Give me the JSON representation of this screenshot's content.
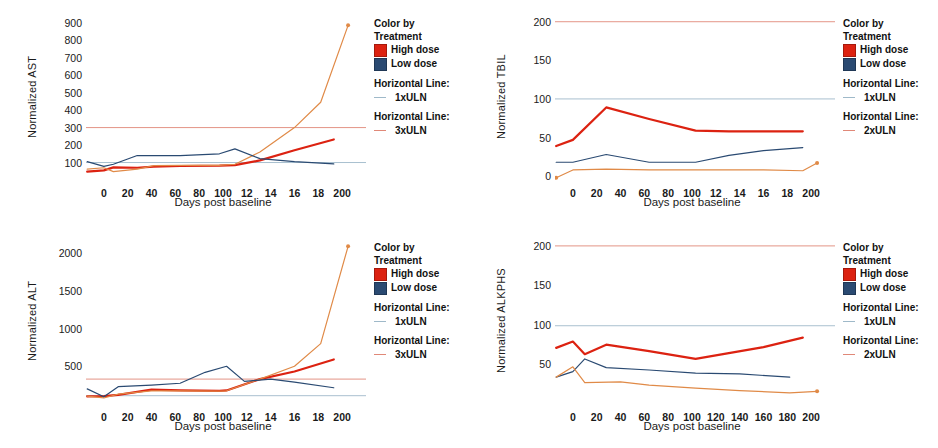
{
  "colors": {
    "high_dose": "#DC2211",
    "low_dose": "#2A4A72",
    "uln1": "#9FB9C9",
    "uln2": "#D98A6B",
    "uln3": "#E08878",
    "patient_orange": "#E08A47",
    "axis": "#4a4a4a",
    "text": "#1a1a1a",
    "background": "#ffffff"
  },
  "legend": {
    "color_by_line1": "Color by",
    "color_by_line2": "Treatment",
    "high_dose": "High dose",
    "low_dose": "Low dose",
    "horizontal_line_label": "Horizontal Line:"
  },
  "panels": [
    {
      "id": "ast",
      "ylabel": "Normalized AST",
      "xlabel": "Days post baseline",
      "yticks": [
        "100",
        "200",
        "300",
        "400",
        "500",
        "600",
        "700",
        "800",
        "900"
      ],
      "xticks": [
        "0",
        "20",
        "40",
        "60",
        "80",
        "100",
        "12",
        "14",
        "16",
        "18",
        "200"
      ],
      "ref1": "1xULN",
      "ref2": "3xULN"
    },
    {
      "id": "tbil",
      "ylabel": "Normalized TBIL",
      "xlabel": "Days post baseline",
      "yticks": [
        "0",
        "50",
        "100",
        "150",
        "200"
      ],
      "xticks": [
        "0",
        "20",
        "40",
        "60",
        "80",
        "100",
        "12",
        "14",
        "16",
        "18",
        "200"
      ],
      "ref1": "1xULN",
      "ref2": "2xULN"
    },
    {
      "id": "alt",
      "ylabel": "Normalized ALT",
      "xlabel": "Days post baseline",
      "yticks": [
        "500",
        "1000",
        "1500",
        "2000"
      ],
      "xticks": [
        "0",
        "20",
        "40",
        "60",
        "80",
        "100",
        "12",
        "14",
        "16",
        "18",
        "200"
      ],
      "ref1": "1xULN",
      "ref2": "3xULN"
    },
    {
      "id": "alkphs",
      "ylabel": "Normalized ALKPHS",
      "xlabel": "Days post baseline",
      "yticks": [
        "50",
        "100",
        "150",
        "200"
      ],
      "xticks": [
        "0",
        "20",
        "40",
        "60",
        "80",
        "100",
        "120",
        "140",
        "160",
        "180",
        "200"
      ],
      "ref1": "1xULN",
      "ref2": "2xULN"
    }
  ],
  "chart_data": [
    {
      "id": "ast",
      "type": "line",
      "title": "",
      "xlabel": "Days post baseline",
      "ylabel": "Normalized AST",
      "xlim": [
        -15,
        215
      ],
      "ylim": [
        0,
        950
      ],
      "grid": false,
      "legend_position": "right",
      "reference_lines": [
        {
          "name": "1xULN",
          "value": 100,
          "color": "#9FB9C9"
        },
        {
          "name": "3xULN",
          "value": 300,
          "color": "#E08878"
        }
      ],
      "series": [
        {
          "name": "High dose subject A",
          "color": "#DC2211",
          "x": [
            -14,
            0,
            8,
            28,
            42,
            64,
            97,
            110,
            131,
            160,
            193
          ],
          "y": [
            48,
            55,
            72,
            70,
            76,
            80,
            82,
            85,
            112,
            170,
            232
          ]
        },
        {
          "name": "High dose subject B (escalating)",
          "color": "#E08A47",
          "x": [
            -14,
            0,
            8,
            28,
            42,
            64,
            97,
            110,
            131,
            160,
            182,
            205
          ],
          "y": [
            62,
            70,
            48,
            62,
            82,
            84,
            84,
            90,
            160,
            300,
            445,
            885
          ],
          "marker_last": true
        },
        {
          "name": "Low dose subject",
          "color": "#2A4A72",
          "x": [
            -14,
            0,
            8,
            28,
            42,
            64,
            97,
            110,
            131,
            160,
            193
          ],
          "y": [
            105,
            78,
            90,
            140,
            140,
            140,
            150,
            178,
            122,
            105,
            92
          ]
        }
      ]
    },
    {
      "id": "tbil",
      "type": "line",
      "title": "",
      "xlabel": "Days post baseline",
      "ylabel": "Normalized TBIL",
      "xlim": [
        -15,
        215
      ],
      "ylim": [
        -5,
        210
      ],
      "grid": false,
      "legend_position": "right",
      "reference_lines": [
        {
          "name": "1xULN",
          "value": 100,
          "color": "#9FB9C9"
        },
        {
          "name": "2xULN",
          "value": 200,
          "color": "#E08878"
        }
      ],
      "series": [
        {
          "name": "High dose subject",
          "color": "#DC2211",
          "x": [
            -14,
            0,
            28,
            64,
            103,
            131,
            160,
            193
          ],
          "y": [
            39,
            47,
            89,
            74,
            59,
            58,
            58,
            58
          ]
        },
        {
          "name": "Low dose subject",
          "color": "#2A4A72",
          "x": [
            -14,
            0,
            28,
            64,
            103,
            131,
            160,
            193
          ],
          "y": [
            18,
            18,
            28,
            18,
            18,
            27,
            33,
            37
          ]
        },
        {
          "name": "Second subject (orange)",
          "color": "#E08A47",
          "x": [
            -14,
            0,
            28,
            64,
            103,
            160,
            193,
            205
          ],
          "y": [
            -2,
            8,
            9,
            8,
            8,
            8,
            7,
            17
          ],
          "marker_first": true,
          "marker_last": true
        }
      ]
    },
    {
      "id": "alt",
      "type": "line",
      "title": "",
      "xlabel": "Days post baseline",
      "ylabel": "Normalized ALT",
      "xlim": [
        -15,
        215
      ],
      "ylim": [
        0,
        2200
      ],
      "grid": false,
      "legend_position": "right",
      "reference_lines": [
        {
          "name": "1xULN",
          "value": 110,
          "color": "#9FB9C9"
        },
        {
          "name": "3xULN",
          "value": 330,
          "color": "#E08878"
        }
      ],
      "series": [
        {
          "name": "High dose subject A",
          "color": "#DC2211",
          "x": [
            -14,
            0,
            12,
            40,
            64,
            97,
            103,
            131,
            160,
            193
          ],
          "y": [
            100,
            105,
            120,
            190,
            180,
            175,
            180,
            330,
            430,
            590
          ]
        },
        {
          "name": "High dose subject B (escalating)",
          "color": "#E08A47",
          "x": [
            -14,
            0,
            12,
            40,
            64,
            97,
            103,
            131,
            160,
            182,
            205
          ],
          "y": [
            105,
            80,
            130,
            175,
            175,
            170,
            175,
            330,
            500,
            800,
            2090
          ],
          "marker_last": true
        },
        {
          "name": "Low dose subject",
          "color": "#2A4A72",
          "x": [
            -14,
            0,
            12,
            40,
            64,
            85,
            103,
            118,
            140,
            160,
            193
          ],
          "y": [
            200,
            95,
            230,
            250,
            275,
            420,
            500,
            300,
            330,
            290,
            215
          ]
        }
      ]
    },
    {
      "id": "alkphs",
      "type": "line",
      "title": "",
      "xlabel": "Days post baseline",
      "ylabel": "Normalized ALKPHS",
      "xlim": [
        -15,
        215
      ],
      "ylim": [
        0,
        210
      ],
      "grid": false,
      "legend_position": "right",
      "reference_lines": [
        {
          "name": "1xULN",
          "value": 99,
          "color": "#9FB9C9"
        },
        {
          "name": "2xULN",
          "value": 200,
          "color": "#E08878"
        }
      ],
      "series": [
        {
          "name": "High dose subject",
          "color": "#DC2211",
          "x": [
            -14,
            0,
            10,
            28,
            64,
            103,
            160,
            193
          ],
          "y": [
            71,
            79,
            63,
            75,
            67,
            57,
            72,
            84
          ]
        },
        {
          "name": "Low dose subject",
          "color": "#2A4A72",
          "x": [
            -14,
            0,
            10,
            28,
            64,
            103,
            140,
            182
          ],
          "y": [
            34,
            41,
            57,
            46,
            43,
            39,
            38,
            34
          ]
        },
        {
          "name": "Second subject (orange)",
          "color": "#E08A47",
          "x": [
            -14,
            0,
            10,
            40,
            64,
            103,
            140,
            182,
            205
          ],
          "y": [
            34,
            47,
            27,
            28,
            24,
            20,
            17,
            14,
            16
          ],
          "marker_last": true
        }
      ]
    }
  ]
}
